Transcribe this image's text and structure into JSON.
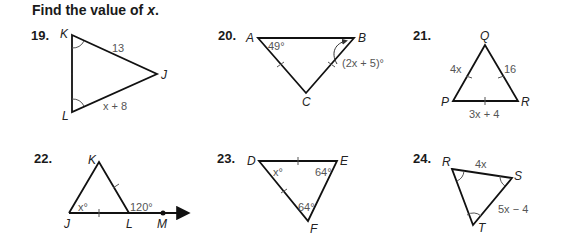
{
  "instructions": {
    "text_prefix": "Find the value of ",
    "variable": "x",
    "text_suffix": "."
  },
  "problems": [
    {
      "number": "19.",
      "vertices": [
        "K",
        "J",
        "L"
      ],
      "labels": {
        "KJ": "13",
        "LJ": "x + 8"
      }
    },
    {
      "number": "20.",
      "vertices": [
        "A",
        "B",
        "C"
      ],
      "labels": {
        "angle_A": "49°",
        "angle_B": "(2x + 5)°"
      }
    },
    {
      "number": "21.",
      "vertices": [
        "Q",
        "P",
        "R"
      ],
      "labels": {
        "PQ": "4x",
        "QR": "16",
        "PR": "3x + 4"
      }
    },
    {
      "number": "22.",
      "vertices": [
        "K",
        "J",
        "L",
        "M"
      ],
      "labels": {
        "angle_J": "x°",
        "angle_KLM": "120°"
      }
    },
    {
      "number": "23.",
      "vertices": [
        "D",
        "E",
        "F"
      ],
      "labels": {
        "angle_D": "x°",
        "angle_E": "64°",
        "angle_F": "64°"
      }
    },
    {
      "number": "24.",
      "vertices": [
        "R",
        "S",
        "T"
      ],
      "labels": {
        "RS": "4x",
        "ST": "5x − 4"
      }
    }
  ]
}
